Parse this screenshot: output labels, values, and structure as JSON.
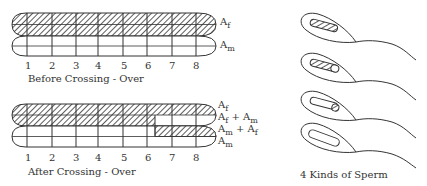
{
  "before": {
    "caption": "Before Crossing - Over",
    "labels": [
      {
        "base": "A",
        "sub": "f"
      },
      {
        "base": "A",
        "sub": "m"
      }
    ]
  },
  "after": {
    "caption": "After Crossing - Over",
    "labels": [
      {
        "base": "A",
        "sub": "f"
      },
      {
        "text": "Af + Am"
      },
      {
        "text": "Am + Af"
      },
      {
        "base": "A",
        "sub": "m"
      }
    ]
  },
  "positions": [
    "1",
    "2",
    "3",
    "4",
    "5",
    "6",
    "7",
    "8"
  ],
  "sperm": {
    "caption": "4 Kinds of Sperm"
  },
  "colors": {
    "ink": "#333333",
    "background": "#ffffff"
  }
}
